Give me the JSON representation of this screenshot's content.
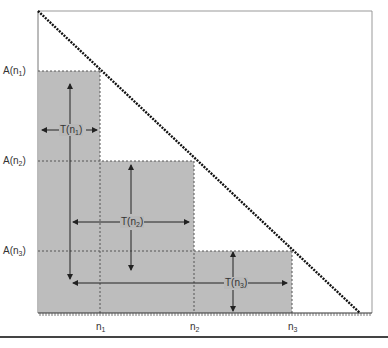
{
  "diagram": {
    "type": "staircase-area-under-diagonal",
    "colors": {
      "shade": "#bdbdbd",
      "line": "#333333",
      "frame": "#888888",
      "diagonal": "#111111"
    },
    "y_labels": [
      {
        "base": "A(n",
        "sub": "1",
        "close": ")"
      },
      {
        "base": "A(n",
        "sub": "2",
        "close": ")"
      },
      {
        "base": "A(n",
        "sub": "3",
        "close": ")"
      }
    ],
    "x_labels": [
      {
        "base": "n",
        "sub": "1"
      },
      {
        "base": "n",
        "sub": "2"
      },
      {
        "base": "n",
        "sub": "3"
      }
    ],
    "interval_labels": [
      {
        "base": "T(n",
        "sub": "1",
        "close": ")"
      },
      {
        "base": "T(n",
        "sub": "2",
        "close": ")"
      },
      {
        "base": "T(n",
        "sub": "3",
        "close": ")"
      }
    ]
  }
}
